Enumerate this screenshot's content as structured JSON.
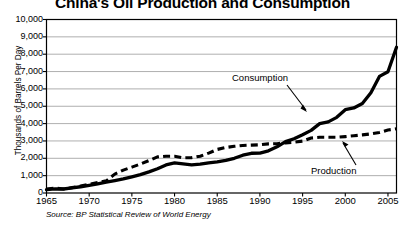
{
  "chart_data": {
    "type": "line",
    "title": "China's Oil Production and Consumption",
    "xlabel": "",
    "ylabel": "Thousands of Barrels Per Day",
    "xlim": [
      1965,
      2006
    ],
    "ylim": [
      0,
      10000
    ],
    "grid": true,
    "legend_position": "inline-annotations",
    "source": "Source: BP Statistical Review of World Energy",
    "x_tick_labels": [
      "1965",
      "1970",
      "1975",
      "1980",
      "1985",
      "1990",
      "1995",
      "2000",
      "2005"
    ],
    "x_ticks": [
      1965,
      1970,
      1975,
      1980,
      1985,
      1990,
      1995,
      2000,
      2005
    ],
    "y_tick_labels": [
      "0",
      "1,000",
      "2,000",
      "3,000",
      "4,000",
      "5,000",
      "6,000",
      "7,000",
      "8,000",
      "9,000",
      "10,000"
    ],
    "y_ticks": [
      0,
      1000,
      2000,
      3000,
      4000,
      5000,
      6000,
      7000,
      8000,
      9000,
      10000
    ],
    "x": [
      1965,
      1966,
      1967,
      1968,
      1969,
      1970,
      1971,
      1972,
      1973,
      1974,
      1975,
      1976,
      1977,
      1978,
      1979,
      1980,
      1981,
      1982,
      1983,
      1984,
      1985,
      1986,
      1987,
      1988,
      1989,
      1990,
      1991,
      1992,
      1993,
      1994,
      1995,
      1996,
      1997,
      1998,
      1999,
      2000,
      2001,
      2002,
      2003,
      2004,
      2005,
      2006
    ],
    "series": [
      {
        "name": "Consumption",
        "style": "solid",
        "color": "#000000",
        "values": [
          200,
          240,
          230,
          290,
          360,
          440,
          530,
          620,
          720,
          810,
          930,
          1060,
          1220,
          1400,
          1620,
          1730,
          1680,
          1620,
          1660,
          1740,
          1790,
          1880,
          2000,
          2180,
          2290,
          2300,
          2430,
          2660,
          2960,
          3130,
          3360,
          3610,
          4000,
          4100,
          4360,
          4800,
          4900,
          5160,
          5780,
          6720,
          6990,
          8400
        ]
      },
      {
        "name": "Production",
        "style": "dashed",
        "color": "#000000",
        "values": [
          230,
          280,
          230,
          310,
          400,
          500,
          600,
          700,
          1090,
          1320,
          1490,
          1670,
          1870,
          2080,
          2120,
          2120,
          2030,
          2040,
          2120,
          2300,
          2510,
          2620,
          2690,
          2740,
          2760,
          2780,
          2830,
          2840,
          2890,
          2930,
          2990,
          3170,
          3210,
          3210,
          3210,
          3250,
          3300,
          3350,
          3410,
          3490,
          3630,
          3700
        ]
      }
    ]
  },
  "annotations": {
    "consumption_label": "Consumption",
    "production_label": "Production"
  }
}
